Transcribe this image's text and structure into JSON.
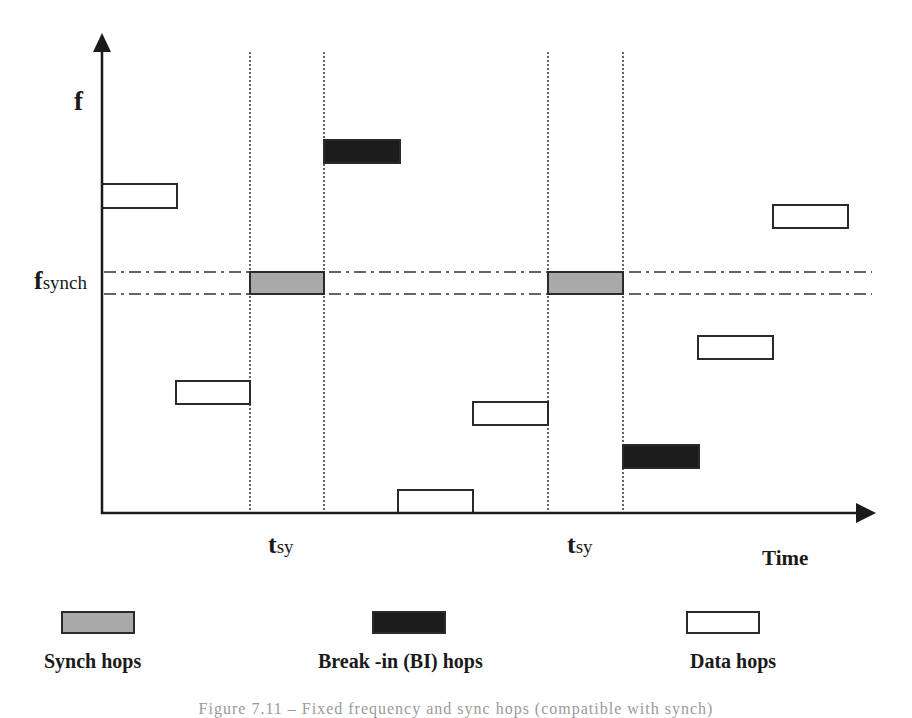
{
  "chart_data": {
    "type": "timing-diagram",
    "title": "",
    "xlabel": "Time",
    "ylabel": "f",
    "y_marker_label": {
      "main": "f",
      "sub": "synch"
    },
    "x_marker_labels": [
      {
        "main": "t",
        "sub": "sy"
      },
      {
        "main": "t",
        "sub": "sy"
      }
    ],
    "colors": {
      "synch": "#a9a9a9",
      "break_in": "#1c1c1c",
      "data": "#ffffff",
      "stroke": "#2a2a2a"
    },
    "hops": [
      {
        "type": "data",
        "x": 102,
        "y": 184,
        "w": 75,
        "h": 24
      },
      {
        "type": "data",
        "x": 176,
        "y": 381,
        "w": 74,
        "h": 23
      },
      {
        "type": "synch",
        "x": 250,
        "y": 272,
        "w": 74,
        "h": 22
      },
      {
        "type": "break_in",
        "x": 324,
        "y": 140,
        "w": 76,
        "h": 23
      },
      {
        "type": "data",
        "x": 398,
        "y": 490,
        "w": 75,
        "h": 23
      },
      {
        "type": "data",
        "x": 473,
        "y": 402,
        "w": 75,
        "h": 23
      },
      {
        "type": "synch",
        "x": 548,
        "y": 272,
        "w": 75,
        "h": 22
      },
      {
        "type": "break_in",
        "x": 623,
        "y": 445,
        "w": 76,
        "h": 23
      },
      {
        "type": "data",
        "x": 698,
        "y": 336,
        "w": 75,
        "h": 23
      },
      {
        "type": "data",
        "x": 773,
        "y": 205,
        "w": 75,
        "h": 23
      }
    ],
    "sync_windows_x": [
      [
        250,
        324
      ],
      [
        548,
        623
      ]
    ],
    "fsynch_band_y": [
      272,
      294
    ],
    "legend": [
      {
        "type": "synch",
        "label": "Synch hops"
      },
      {
        "type": "break_in",
        "label": "Break -in (BI) hops"
      },
      {
        "type": "data",
        "label": "Data hops"
      }
    ]
  },
  "caption": "Figure 7.11 – Fixed frequency and sync hops (compatible with synch)"
}
